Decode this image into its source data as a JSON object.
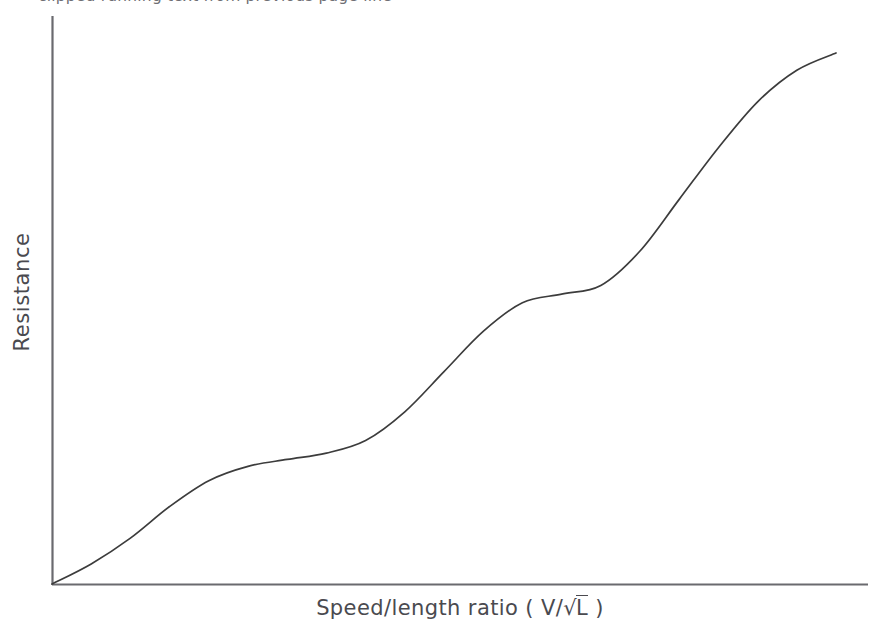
{
  "figure": {
    "caption_cropped": "clipped running text from previous page line",
    "background_color": "#ffffff",
    "line_color": "#3c3c3c",
    "axis_color": "#6a6a6f",
    "text_color": "#4a4a4f"
  },
  "axes": {
    "y_title": "Resistance",
    "x_title_prefix": "Speed/length ratio ( V/",
    "x_title_radical": "√",
    "x_title_radicand": "L",
    "x_title_suffix": " )",
    "x_title_full": "Speed/length ratio ( V/√L )"
  },
  "chart_data": {
    "type": "line",
    "title": "",
    "subtitle": "",
    "xlabel": "Speed/length ratio ( V/√L )",
    "ylabel": "Resistance",
    "xlim": [
      0,
      1
    ],
    "ylim": [
      0,
      1
    ],
    "grid": false,
    "legend": false,
    "legend_position": "none",
    "axis_ticks": "none",
    "tick_labels_x": [],
    "tick_labels_y": [],
    "annotations": [],
    "series": [
      {
        "name": "Resistance curve",
        "color": "#3c3c3c",
        "x": [
          0.0,
          0.05,
          0.1,
          0.15,
          0.2,
          0.25,
          0.3,
          0.35,
          0.4,
          0.45,
          0.5,
          0.55,
          0.6,
          0.65,
          0.7,
          0.75,
          0.8,
          0.85,
          0.9,
          0.95,
          1.0
        ],
        "y": [
          0.0,
          0.035,
          0.08,
          0.135,
          0.18,
          0.205,
          0.217,
          0.228,
          0.25,
          0.3,
          0.37,
          0.44,
          0.49,
          0.505,
          0.52,
          0.58,
          0.67,
          0.76,
          0.84,
          0.895,
          0.925
        ]
      }
    ]
  },
  "geometry": {
    "origin_x": 52,
    "origin_y": 584,
    "y_axis_top": 16,
    "x_axis_right": 868,
    "curve_end_x": 836,
    "curve_end_y": 53
  }
}
